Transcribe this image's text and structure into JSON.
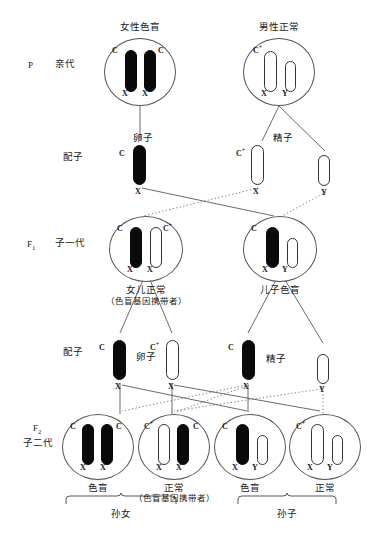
{
  "diagram": {
    "title_semantic": "color-blindness X-linked inheritance pedigree",
    "generations": [
      {
        "code": "P",
        "label": "亲代"
      },
      {
        "code": "F1",
        "label": "子一代"
      },
      {
        "code": "F2",
        "label": "子二代"
      }
    ],
    "gamete_label": "配子",
    "egg_label": "卵子",
    "sperm_label": "精子",
    "parents": [
      {
        "title": "女性色盲",
        "alleles": [
          "C",
          "C"
        ],
        "sex_chromosomes": [
          "X",
          "X"
        ],
        "shading": [
          "dark",
          "dark"
        ]
      },
      {
        "title": "男性正常",
        "alleles": [
          "C⁺",
          ""
        ],
        "sex_chromosomes": [
          "X",
          "Y"
        ],
        "shading": [
          "light",
          "light"
        ]
      }
    ],
    "gametes_row1": [
      {
        "allele": "C",
        "sex": "X",
        "shading": "dark",
        "group": "egg"
      },
      {
        "allele": "C⁺",
        "sex": "X",
        "shading": "light",
        "group": "sperm"
      },
      {
        "allele": "",
        "sex": "Y",
        "shading": "light",
        "group": "sperm"
      }
    ],
    "f1": [
      {
        "alleles": [
          "C",
          "C⁺"
        ],
        "sex_chromosomes": [
          "X",
          "X"
        ],
        "shading": [
          "dark",
          "light"
        ],
        "caption": "女儿正常",
        "caption2": "（色盲基因携带者）"
      },
      {
        "alleles": [
          "C",
          ""
        ],
        "sex_chromosomes": [
          "X",
          "Y"
        ],
        "shading": [
          "dark",
          "light"
        ],
        "caption": "儿子色盲",
        "caption2": ""
      }
    ],
    "gametes_row2": [
      {
        "allele": "C",
        "sex": "X",
        "shading": "dark",
        "group": "egg"
      },
      {
        "allele": "C⁺",
        "sex": "X",
        "shading": "light",
        "group": "egg"
      },
      {
        "allele": "C",
        "sex": "X",
        "shading": "dark",
        "group": "sperm"
      },
      {
        "allele": "",
        "sex": "Y",
        "shading": "light",
        "group": "sperm"
      }
    ],
    "f2": [
      {
        "alleles": [
          "C",
          "C"
        ],
        "sex_chromosomes": [
          "X",
          "X"
        ],
        "shading": [
          "dark",
          "dark"
        ],
        "caption": "色盲",
        "caption2": ""
      },
      {
        "alleles": [
          "C⁺",
          "C"
        ],
        "sex_chromosomes": [
          "X",
          "X"
        ],
        "shading": [
          "light",
          "dark"
        ],
        "caption": "正常",
        "caption2": "（色盲基因携带者）"
      },
      {
        "alleles": [
          "C",
          ""
        ],
        "sex_chromosomes": [
          "X",
          "Y"
        ],
        "shading": [
          "dark",
          "light"
        ],
        "caption": "色盲",
        "caption2": ""
      },
      {
        "alleles": [
          "C⁺",
          ""
        ],
        "sex_chromosomes": [
          "X",
          "Y"
        ],
        "shading": [
          "light",
          "light"
        ],
        "caption": "正常",
        "caption2": ""
      }
    ],
    "braces": [
      {
        "label": "孙女"
      },
      {
        "label": "孙子"
      }
    ],
    "colors": {
      "mutant_chromosome": "#0a0a0a",
      "normal_chromosome": "#ffffff",
      "outline": "#555555",
      "text": "#1a1a1a"
    }
  }
}
